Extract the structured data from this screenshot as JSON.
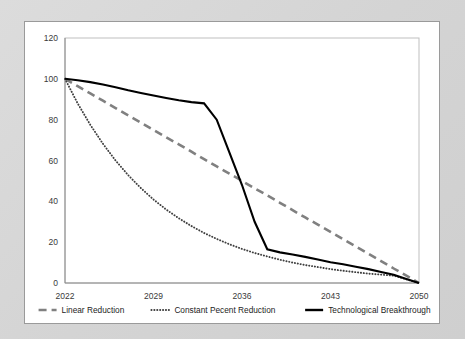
{
  "chart_data": {
    "type": "line",
    "title": "",
    "subtitle": "",
    "xlabel": "",
    "ylabel": "",
    "xlim": [
      2022,
      2050
    ],
    "ylim": [
      0,
      120
    ],
    "ytick_values": [
      0,
      20,
      40,
      60,
      80,
      100,
      120
    ],
    "ytick_labels": [
      "0",
      "20",
      "40",
      "60",
      "80",
      "100",
      "120"
    ],
    "xtick_values": [
      2022,
      2029,
      2036,
      2043,
      2050
    ],
    "xtick_labels": [
      "2022",
      "2029",
      "2036",
      "2043",
      "2050"
    ],
    "grid": false,
    "legend_position": "bottom",
    "x": [
      2022,
      2023,
      2024,
      2025,
      2026,
      2027,
      2028,
      2029,
      2030,
      2031,
      2032,
      2033,
      2034,
      2035,
      2036,
      2037,
      2038,
      2039,
      2040,
      2041,
      2042,
      2043,
      2044,
      2045,
      2046,
      2047,
      2048,
      2049,
      2050
    ],
    "series": [
      {
        "name": "Linear Reduction",
        "style": "dashed",
        "color": "#808080",
        "values": [
          100,
          96.4,
          92.9,
          89.3,
          85.7,
          82.1,
          78.6,
          75,
          71.4,
          67.9,
          64.3,
          60.7,
          57.1,
          53.6,
          50,
          46.4,
          42.9,
          39.3,
          35.7,
          32.1,
          28.6,
          25,
          21.4,
          17.9,
          14.3,
          10.7,
          7.1,
          3.6,
          0
        ]
      },
      {
        "name": "Constant Pecent Reduction",
        "style": "dotted",
        "color": "#3f3f3f",
        "values": [
          100,
          88,
          77.5,
          68.2,
          60,
          52.8,
          46.5,
          40.9,
          36,
          31.7,
          27.9,
          24.5,
          21.6,
          19,
          16.7,
          14.7,
          13,
          11.4,
          10,
          8.8,
          7.8,
          6.8,
          6,
          5.3,
          4.6,
          4.1,
          3.6,
          1.8,
          0
        ]
      },
      {
        "name": "Technological Breakthrough",
        "style": "solid",
        "color": "#000000",
        "values": [
          100,
          99.3,
          98.4,
          97.2,
          95.9,
          94.4,
          93.1,
          91.8,
          90.6,
          89.5,
          88.6,
          88,
          80,
          64,
          48,
          30,
          16.5,
          15,
          14,
          12.8,
          11.5,
          10.2,
          9.2,
          8,
          6.8,
          5.4,
          4,
          2,
          0
        ]
      }
    ]
  },
  "legend": {
    "items": [
      {
        "label": "Linear Reduction",
        "marker": "dashed-line-marker"
      },
      {
        "label": "Constant Pecent Reduction",
        "marker": "dotted-line-marker"
      },
      {
        "label": "Technological Breakthrough",
        "marker": "solid-line-marker"
      }
    ]
  }
}
